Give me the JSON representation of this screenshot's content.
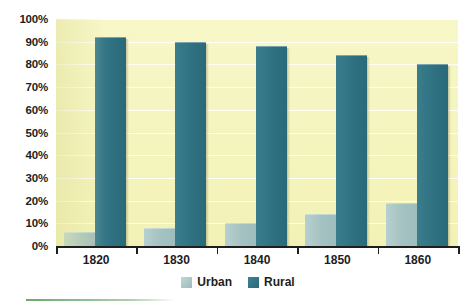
{
  "chart_data": {
    "type": "bar",
    "title": "",
    "subtitle": "",
    "xlabel": "",
    "ylabel": "",
    "categories": [
      "1820",
      "1830",
      "1840",
      "1850",
      "1860"
    ],
    "series": [
      {
        "name": "Urban",
        "color": "#a9c7c6",
        "values": [
          6,
          8,
          10,
          14,
          19
        ]
      },
      {
        "name": "Rural",
        "color": "#2f7183",
        "values": [
          92,
          90,
          88,
          84,
          80
        ]
      }
    ],
    "ylim": [
      0,
      100
    ],
    "ytick_values": [
      0,
      10,
      20,
      30,
      40,
      50,
      60,
      70,
      80,
      90,
      100
    ],
    "ytick_labels": [
      "0%",
      "10%",
      "20%",
      "30%",
      "40%",
      "50%",
      "60%",
      "70%",
      "80%",
      "90%",
      "100%"
    ],
    "grid": true,
    "legend_position": "bottom",
    "plot_background": "#f4f4bd",
    "value_suffix": "%"
  },
  "legend": {
    "items": [
      {
        "label": "Urban",
        "swatch": "urban-swatch"
      },
      {
        "label": "Rural",
        "swatch": "rural-swatch"
      }
    ]
  }
}
